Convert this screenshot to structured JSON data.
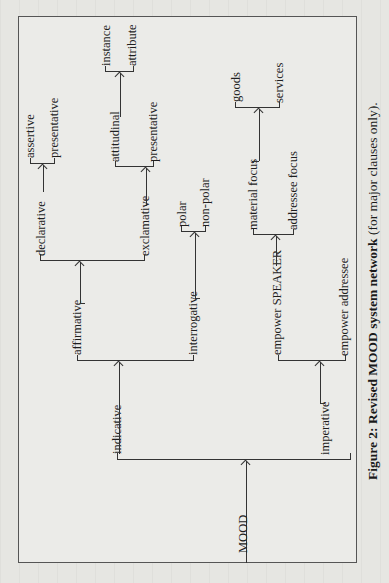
{
  "diagram": {
    "root": "MOOD",
    "nodes": {
      "mood": "MOOD",
      "indicative": "indicative",
      "imperative": "imperative",
      "affirmative": "affirmative",
      "interrogative": "interrogative",
      "declarative": "declarative",
      "exclamative": "exclamative",
      "assertive": "assertive",
      "presentative_decl": "presentative",
      "attitudinal": "attitudinal",
      "presentative_excl": "presentative",
      "instance": "instance",
      "attribute": "attribute",
      "polar": "polar",
      "non_polar": "non-polar",
      "empower_speaker": "empower SPEAKER",
      "empower_addressee": "empower addressee",
      "material_focus": "material focus",
      "addressee_focus": "addressee focus",
      "goods": "goods",
      "services": "services"
    },
    "edges": [
      [
        "MOOD",
        "indicative"
      ],
      [
        "MOOD",
        "imperative"
      ],
      [
        "indicative",
        "affirmative"
      ],
      [
        "indicative",
        "interrogative"
      ],
      [
        "affirmative",
        "declarative"
      ],
      [
        "affirmative",
        "exclamative"
      ],
      [
        "declarative",
        "assertive"
      ],
      [
        "declarative",
        "presentative"
      ],
      [
        "exclamative",
        "attitudinal"
      ],
      [
        "exclamative",
        "presentative"
      ],
      [
        "attitudinal",
        "instance"
      ],
      [
        "attitudinal",
        "attribute"
      ],
      [
        "interrogative",
        "polar"
      ],
      [
        "interrogative",
        "non-polar"
      ],
      [
        "imperative",
        "empower SPEAKER"
      ],
      [
        "imperative",
        "empower addressee"
      ],
      [
        "empower SPEAKER",
        "material focus"
      ],
      [
        "empower SPEAKER",
        "addressee focus"
      ],
      [
        "material focus",
        "goods"
      ],
      [
        "material focus",
        "services"
      ]
    ],
    "caption": {
      "bold": "Figure 2: Revised MOOD system network",
      "normal": " (for major clauses only)."
    }
  }
}
